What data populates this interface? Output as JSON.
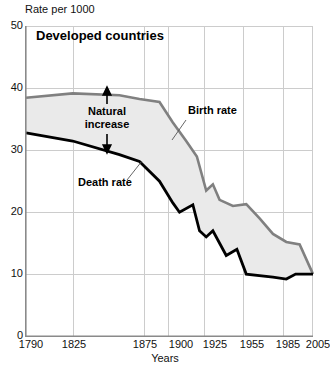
{
  "chart_data": {
    "type": "area",
    "title": "Developed countries",
    "ylabel": "Rate per 1000",
    "xlabel": "Years",
    "ylim": [
      0,
      50
    ],
    "yticks": [
      0,
      10,
      20,
      30,
      40,
      50
    ],
    "xticks": [
      "1790",
      "1825",
      "1875",
      "1900",
      "1925",
      "1955",
      "1985",
      "2005"
    ],
    "xlim": [
      1790,
      2005
    ],
    "grid": true,
    "legend_position": "inline-annotations",
    "annotations": [
      {
        "name": "natural-increase",
        "text": "Natural\nincrease",
        "line1": "Natural",
        "line2": "increase"
      },
      {
        "name": "birth-rate-label",
        "text": "Birth rate"
      },
      {
        "name": "death-rate-label",
        "text": "Death rate"
      }
    ],
    "colors": {
      "birth_rate_line": "#808080",
      "death_rate_line": "#000000",
      "band_fill": "#eaeaea",
      "grid": "#cccccc",
      "axis": "#999999",
      "text": "#111111"
    },
    "series": [
      {
        "name": "Birth rate",
        "color": "#808080",
        "points": [
          {
            "x": 1790,
            "y": 38.5
          },
          {
            "x": 1825,
            "y": 39.2
          },
          {
            "x": 1860,
            "y": 38.9
          },
          {
            "x": 1875,
            "y": 38.3
          },
          {
            "x": 1890,
            "y": 37.8
          },
          {
            "x": 1900,
            "y": 34.5
          },
          {
            "x": 1910,
            "y": 31.5
          },
          {
            "x": 1918,
            "y": 29.0
          },
          {
            "x": 1925,
            "y": 23.5
          },
          {
            "x": 1930,
            "y": 24.5
          },
          {
            "x": 1935,
            "y": 22.0
          },
          {
            "x": 1945,
            "y": 21.0
          },
          {
            "x": 1955,
            "y": 21.3
          },
          {
            "x": 1965,
            "y": 19.0
          },
          {
            "x": 1975,
            "y": 16.5
          },
          {
            "x": 1985,
            "y": 15.2
          },
          {
            "x": 1995,
            "y": 14.8
          },
          {
            "x": 2005,
            "y": 10.0
          }
        ]
      },
      {
        "name": "Death rate",
        "color": "#000000",
        "points": [
          {
            "x": 1790,
            "y": 32.8
          },
          {
            "x": 1825,
            "y": 31.5
          },
          {
            "x": 1860,
            "y": 29.3
          },
          {
            "x": 1875,
            "y": 28.2
          },
          {
            "x": 1890,
            "y": 25.0
          },
          {
            "x": 1900,
            "y": 21.5
          },
          {
            "x": 1905,
            "y": 20.0
          },
          {
            "x": 1915,
            "y": 21.2
          },
          {
            "x": 1920,
            "y": 17.0
          },
          {
            "x": 1925,
            "y": 16.0
          },
          {
            "x": 1930,
            "y": 17.0
          },
          {
            "x": 1940,
            "y": 13.0
          },
          {
            "x": 1948,
            "y": 14.0
          },
          {
            "x": 1955,
            "y": 10.0
          },
          {
            "x": 1975,
            "y": 9.5
          },
          {
            "x": 1985,
            "y": 9.2
          },
          {
            "x": 1992,
            "y": 10.0
          },
          {
            "x": 2005,
            "y": 10.0
          }
        ]
      }
    ]
  },
  "axis": {
    "ylabel": "Rate per 1000",
    "xlabel": "Years",
    "yticks": [
      "50",
      "40",
      "30",
      "20",
      "10",
      "0"
    ],
    "xticks": [
      "1790",
      "1825",
      "1875",
      "1900",
      "1925",
      "1955",
      "1985",
      "2005"
    ]
  },
  "title": "Developed countries",
  "labels": {
    "natural_increase_line1": "Natural",
    "natural_increase_line2": "increase",
    "birth_rate": "Birth rate",
    "death_rate": "Death rate"
  }
}
